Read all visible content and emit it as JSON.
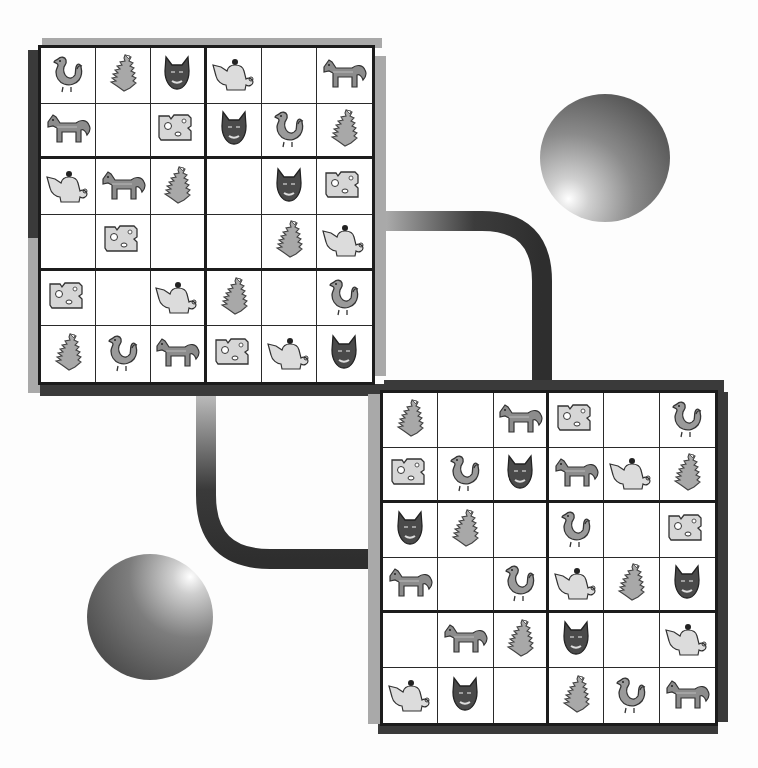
{
  "puzzle": {
    "type": "picture-sudoku",
    "size": 6,
    "box_rows": 2,
    "box_cols": 3,
    "symbols": [
      "duck",
      "pinecone",
      "cat",
      "teapot",
      "horse",
      "cheese"
    ],
    "symbol_colors": {
      "duck": "#9a9a9a",
      "pinecone": "#a8a8a8",
      "cat": "#4a4a4a",
      "teapot": "#dcdcdc",
      "horse": "#8c8c8c",
      "cheese": "#d6d6d6"
    }
  },
  "boards": [
    {
      "id": "board-top-left",
      "cells": [
        [
          "duck",
          "pinecone",
          "cat",
          "teapot",
          "",
          "horse"
        ],
        [
          "horse",
          "",
          "cheese",
          "cat",
          "duck",
          "pinecone"
        ],
        [
          "teapot",
          "horse",
          "pinecone",
          "",
          "cat",
          "cheese"
        ],
        [
          "",
          "cheese",
          "",
          "",
          "pinecone",
          "teapot"
        ],
        [
          "cheese",
          "",
          "teapot",
          "pinecone",
          "",
          "duck"
        ],
        [
          "pinecone",
          "duck",
          "horse",
          "cheese",
          "teapot",
          "cat"
        ]
      ]
    },
    {
      "id": "board-bottom-right",
      "cells": [
        [
          "pinecone",
          "",
          "horse",
          "cheese",
          "",
          "duck"
        ],
        [
          "cheese",
          "duck",
          "cat",
          "horse",
          "teapot",
          "pinecone"
        ],
        [
          "cat",
          "pinecone",
          "",
          "duck",
          "",
          "cheese"
        ],
        [
          "horse",
          "",
          "duck",
          "teapot",
          "pinecone",
          "cat"
        ],
        [
          "",
          "horse",
          "pinecone",
          "cat",
          "",
          "teapot"
        ],
        [
          "teapot",
          "cat",
          "",
          "pinecone",
          "duck",
          "horse"
        ]
      ]
    }
  ],
  "decorations": {
    "spheres": [
      "sphere-top-right",
      "sphere-bottom-left"
    ],
    "pipes": [
      "pipe-top-right",
      "pipe-bottom-left"
    ]
  }
}
